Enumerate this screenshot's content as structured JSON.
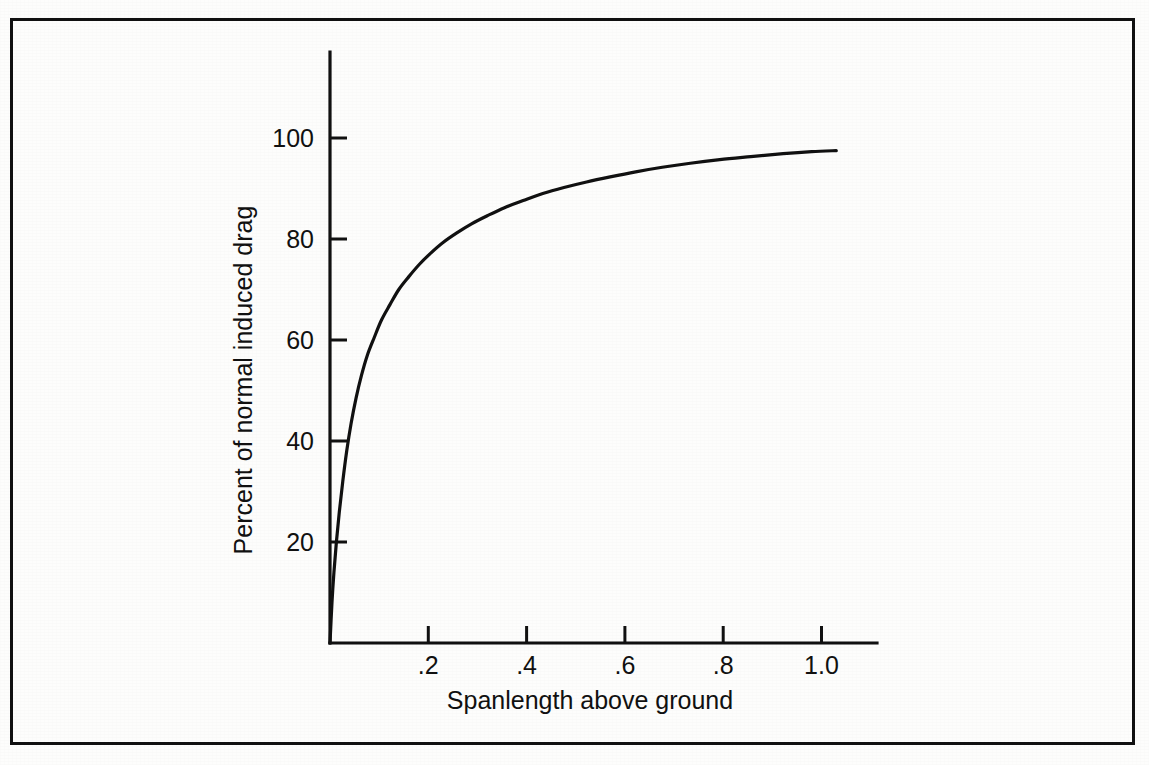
{
  "figure": {
    "border_color": "#111111",
    "background_color": "#fdfdfc"
  },
  "chart_data": {
    "type": "line",
    "title": "",
    "subtitle": "",
    "xlabel": "Spanlength above ground",
    "ylabel": "Percent of normal induced drag",
    "xlim": [
      0,
      1.115
    ],
    "ylim": [
      0,
      113
    ],
    "grid": false,
    "legend": null,
    "xticks": [
      0.2,
      0.4,
      0.6,
      0.8,
      1.0
    ],
    "xtick_labels": [
      ".2",
      ".4",
      ".6",
      ".8",
      "1.0"
    ],
    "yticks": [
      20,
      40,
      60,
      80,
      100
    ],
    "ytick_labels": [
      "20",
      "40",
      "60",
      "80",
      "100"
    ],
    "series": [
      {
        "name": "Induced drag in ground effect",
        "x": [
          0.0,
          0.004,
          0.008,
          0.013,
          0.019,
          0.026,
          0.034,
          0.043,
          0.053,
          0.064,
          0.076,
          0.09,
          0.105,
          0.122,
          0.14,
          0.16,
          0.182,
          0.205,
          0.23,
          0.258,
          0.288,
          0.32,
          0.355,
          0.393,
          0.433,
          0.476,
          0.522,
          0.57,
          0.622,
          0.676,
          0.733,
          0.793,
          0.856,
          0.922,
          0.98,
          1.03
        ],
        "y": [
          0.0,
          8.0,
          14.0,
          20.0,
          26.0,
          32.0,
          38.0,
          43.5,
          48.5,
          53.0,
          57.0,
          60.5,
          64.0,
          67.0,
          70.0,
          72.5,
          75.0,
          77.2,
          79.3,
          81.2,
          83.0,
          84.6,
          86.2,
          87.6,
          89.0,
          90.2,
          91.3,
          92.3,
          93.3,
          94.2,
          95.0,
          95.7,
          96.3,
          96.9,
          97.3,
          97.5
        ]
      }
    ],
    "annotations": []
  },
  "axes_geometry": {
    "origin_x": 330,
    "origin_y": 643,
    "y_axis_top": 52,
    "x_axis_right": 877,
    "px_per_x_unit": 491.5,
    "px_per_y_unit": 5.05
  }
}
